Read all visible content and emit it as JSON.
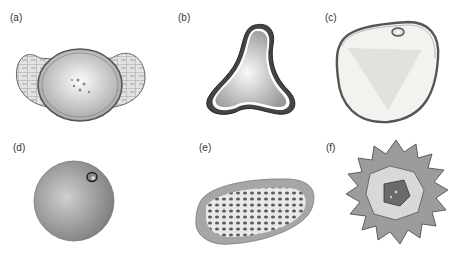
{
  "figure": {
    "panels": [
      {
        "id": "a",
        "label": "(a)",
        "description": "grain with two reticulate air sacs (bisaccate)"
      },
      {
        "id": "b",
        "label": "(b)",
        "description": "triangular grain with thick wall"
      },
      {
        "id": "c",
        "label": "(c)",
        "description": "rounded grain with single pore at top"
      },
      {
        "id": "d",
        "label": "(d)",
        "description": "smooth spherical grain with single pore"
      },
      {
        "id": "e",
        "label": "(e)",
        "description": "elongated grain with reticulate pitted surface"
      },
      {
        "id": "f",
        "label": "(f)",
        "description": "spiny echinate grain"
      }
    ]
  },
  "colors": {
    "background": "#ffffff",
    "grain_light": "#f0f0f0",
    "grain_mid": "#b8b8b8",
    "grain_dark": "#555555",
    "outline": "#333333"
  }
}
